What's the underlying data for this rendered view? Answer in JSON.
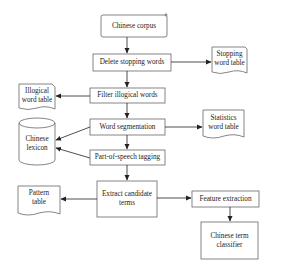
{
  "diagram": {
    "nodes": {
      "corpus": "Chinese corpus",
      "delete_stopping": "Delete stopping words",
      "stopping_table_1": "Stopping",
      "stopping_table_2": "word table",
      "illogical_table_1": "Illogical",
      "illogical_table_2": "word table",
      "filter_illogical": "Filter illogical words",
      "word_segmentation": "Word segmentation",
      "statistics_table_1": "Statistics",
      "statistics_table_2": "word table",
      "lexicon_1": "Chinese",
      "lexicon_2": "lexicon",
      "pos_tagging": "Part-of-speech tagging",
      "extract_1": "Extract candidate",
      "extract_2": "terms",
      "pattern_table_1": "Pattern",
      "pattern_table_2": "table",
      "feature_extraction": "Feature extraction",
      "classifier_1": "Chinese term",
      "classifier_2": "classifier"
    },
    "edges": [
      {
        "from": "Chinese corpus",
        "to": "Delete stopping words"
      },
      {
        "from": "Delete stopping words",
        "to": "Stopping word table"
      },
      {
        "from": "Delete stopping words",
        "to": "Filter illogical words"
      },
      {
        "from": "Filter illogical words",
        "to": "Illogical word table"
      },
      {
        "from": "Filter illogical words",
        "to": "Word segmentation"
      },
      {
        "from": "Word segmentation",
        "to": "Statistics word table"
      },
      {
        "from": "Word segmentation",
        "to": "Chinese lexicon"
      },
      {
        "from": "Word segmentation",
        "to": "Part-of-speech tagging"
      },
      {
        "from": "Part-of-speech tagging",
        "to": "Chinese lexicon"
      },
      {
        "from": "Part-of-speech tagging",
        "to": "Extract candidate terms"
      },
      {
        "from": "Extract candidate terms",
        "to": "Pattern table"
      },
      {
        "from": "Extract candidate terms",
        "to": "Feature extraction"
      },
      {
        "from": "Feature extraction",
        "to": "Chinese term classifier"
      }
    ],
    "colors": {
      "stroke": "#555555",
      "text": "#222222",
      "background": "#ffffff"
    }
  }
}
